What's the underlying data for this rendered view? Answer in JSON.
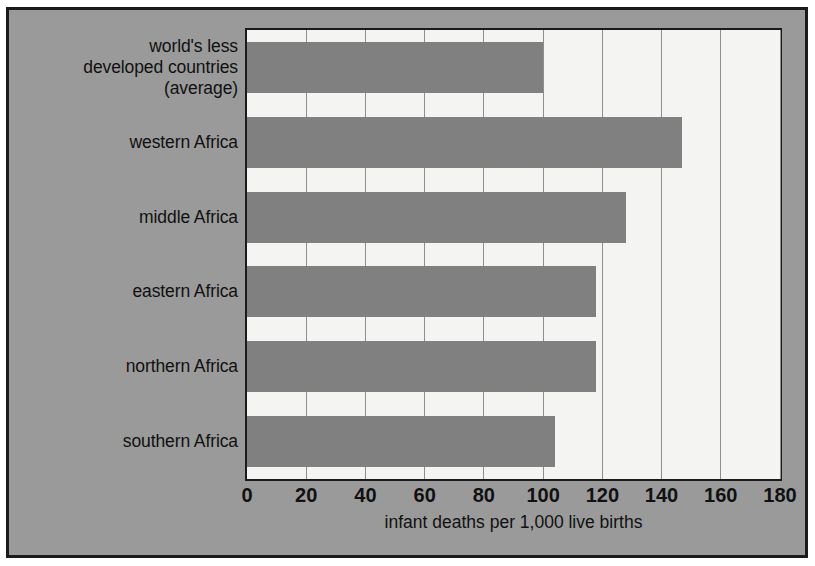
{
  "chart_data": {
    "type": "bar",
    "orientation": "horizontal",
    "title": "",
    "subtitle": "",
    "xlabel": "infant deaths per 1,000 live births",
    "ylabel": "",
    "xlim": [
      0,
      180
    ],
    "xticks": [
      0,
      20,
      40,
      60,
      80,
      100,
      120,
      140,
      160,
      180
    ],
    "xtick_labels": [
      "0",
      "20",
      "40",
      "60",
      "80",
      "100",
      "120",
      "140",
      "160",
      "180"
    ],
    "grid": "vertical",
    "legend": null,
    "categories": [
      "world's less developed countries (average)",
      "western Africa",
      "middle Africa",
      "eastern Africa",
      "northern Africa",
      "southern Africa"
    ],
    "category_label_lines": [
      [
        "world's less",
        "developed countries",
        "(average)"
      ],
      [
        "western Africa"
      ],
      [
        "middle Africa"
      ],
      [
        "eastern Africa"
      ],
      [
        "northern Africa"
      ],
      [
        "southern Africa"
      ]
    ],
    "values": [
      100,
      147,
      128,
      118,
      118,
      104
    ],
    "bar_color": "#808080",
    "plot_background": "#f4f4f2",
    "figure_background": "#9a9a9a",
    "axis_color": "#1b1b1b",
    "gridline_color": "#8e8e8e",
    "text_color": "#111111"
  },
  "axis": {
    "x_title": "infant deaths per 1,000 live births"
  }
}
